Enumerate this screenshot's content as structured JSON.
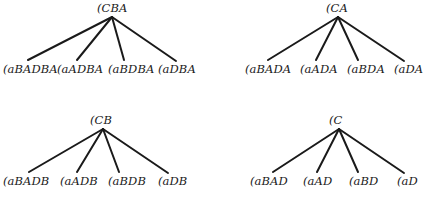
{
  "figure": {
    "background_color": "#ffffff",
    "ink_color": "#1a1a1a",
    "width": 425,
    "height": 204
  },
  "trees": [
    {
      "id": "tree-cba",
      "position": {
        "x": 0,
        "y": 0
      },
      "root": {
        "label": "(CBA",
        "x": 97,
        "y": 3
      },
      "apex": {
        "x": 112,
        "y": 17
      },
      "leaves": [
        {
          "label": "(aBADBA",
          "x": 3,
          "y": 64,
          "line_end_x": 28,
          "line_end_y": 60
        },
        {
          "label": "(aADBA",
          "x": 57,
          "y": 64,
          "line_end_x": 77,
          "line_end_y": 60
        },
        {
          "label": "(aBDBA",
          "x": 108,
          "y": 64,
          "line_end_x": 124,
          "line_end_y": 60
        },
        {
          "label": "(aDBA",
          "x": 158,
          "y": 64,
          "line_end_x": 176,
          "line_end_y": 61
        }
      ]
    },
    {
      "id": "tree-ca",
      "position": {
        "x": 212,
        "y": 0
      },
      "root": {
        "label": "(CA",
        "x": 114,
        "y": 3
      },
      "apex": {
        "x": 126,
        "y": 17
      },
      "leaves": [
        {
          "label": "(aBADA",
          "x": 33,
          "y": 64,
          "line_end_x": 56,
          "line_end_y": 60
        },
        {
          "label": "(aADA",
          "x": 88,
          "y": 64,
          "line_end_x": 104,
          "line_end_y": 60
        },
        {
          "label": "(aBDA",
          "x": 135,
          "y": 64,
          "line_end_x": 146,
          "line_end_y": 60
        },
        {
          "label": "(aDA",
          "x": 182,
          "y": 64,
          "line_end_x": 192,
          "line_end_y": 61
        }
      ]
    },
    {
      "id": "tree-cb",
      "position": {
        "x": 0,
        "y": 102
      },
      "root": {
        "label": "(CB",
        "x": 90,
        "y": 13
      },
      "apex": {
        "x": 103,
        "y": 27
      },
      "leaves": [
        {
          "label": "(aBADB",
          "x": 3,
          "y": 74,
          "line_end_x": 29,
          "line_end_y": 70
        },
        {
          "label": "(aADB",
          "x": 60,
          "y": 74,
          "line_end_x": 77,
          "line_end_y": 70
        },
        {
          "label": "(aBDB",
          "x": 108,
          "y": 74,
          "line_end_x": 119,
          "line_end_y": 70
        },
        {
          "label": "(aDB",
          "x": 158,
          "y": 74,
          "line_end_x": 168,
          "line_end_y": 71
        }
      ]
    },
    {
      "id": "tree-c",
      "position": {
        "x": 212,
        "y": 102
      },
      "root": {
        "label": "(C",
        "x": 117,
        "y": 13
      },
      "apex": {
        "x": 127,
        "y": 27
      },
      "leaves": [
        {
          "label": "(aBAD",
          "x": 38,
          "y": 74,
          "line_end_x": 61,
          "line_end_y": 70
        },
        {
          "label": "(aAD",
          "x": 91,
          "y": 74,
          "line_end_x": 105,
          "line_end_y": 70
        },
        {
          "label": "(aBD",
          "x": 137,
          "y": 74,
          "line_end_x": 146,
          "line_end_y": 70
        },
        {
          "label": "(aD",
          "x": 185,
          "y": 74,
          "line_end_x": 192,
          "line_end_y": 71
        }
      ]
    }
  ]
}
